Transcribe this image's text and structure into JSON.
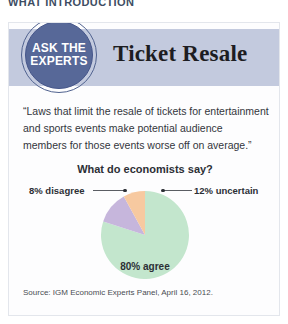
{
  "page": {
    "running_head": "WHAT INTRODUCTION"
  },
  "card": {
    "badge": {
      "line1": "ASK THE",
      "line2": "EXPERTS"
    },
    "title": "Ticket Resale",
    "quote": "“Laws that limit the resale of tickets for entertainment and sports events make potential audience members for those events worse off on average.”",
    "source": "Source: IGM Economic Experts Panel, April 16, 2012."
  },
  "colors": {
    "header_band": "#c3cade",
    "badge_fill": "#576898",
    "badge_ring": "#50628f",
    "agree": "#c3e6cd",
    "uncertain": "#c6b6dc",
    "disagree": "#f7c9a0",
    "card_background": "#fdfdfe",
    "card_border": "#e3e6ec"
  },
  "chart_data": {
    "type": "pie",
    "title": "What do economists say?",
    "categories": [
      "80% agree",
      "12% uncertain",
      "8% disagree"
    ],
    "labels": {
      "agree": "80% agree",
      "uncertain": "12% uncertain",
      "disagree": "8% disagree"
    },
    "values": [
      80,
      12,
      8
    ],
    "slice_colors": [
      "#c3e6cd",
      "#c6b6dc",
      "#f7c9a0"
    ],
    "units": "percent",
    "legend": "none",
    "annotations": [
      "8% disagree",
      "12% uncertain",
      "80% agree"
    ],
    "source": "Source: IGM Economic Experts Panel, April 16, 2012."
  }
}
